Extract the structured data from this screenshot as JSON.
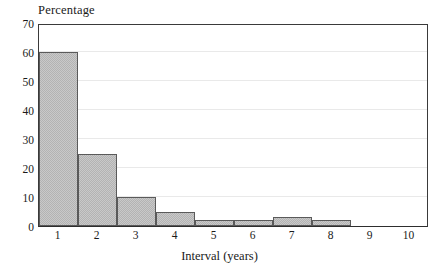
{
  "chart_data": {
    "type": "bar",
    "title": "",
    "ylabel": "Percentage",
    "xlabel": "Interval (years)",
    "categories": [
      "1",
      "2",
      "3",
      "4",
      "5",
      "6",
      "7",
      "8",
      "9",
      "10"
    ],
    "values": [
      60,
      25,
      10,
      5,
      2,
      2,
      3,
      2,
      0,
      0
    ],
    "ylim": [
      0,
      70
    ],
    "yticks": [
      0,
      10,
      20,
      30,
      40,
      50,
      60,
      70
    ],
    "xlim": [
      0.5,
      10.5
    ],
    "grid": true,
    "legend": null,
    "bar_fill_color": "#c9c9c9",
    "bar_edge_color": "#5a5a5a",
    "axis_color": "#3a3a3a",
    "gridline_color": "#e9e9e9"
  }
}
